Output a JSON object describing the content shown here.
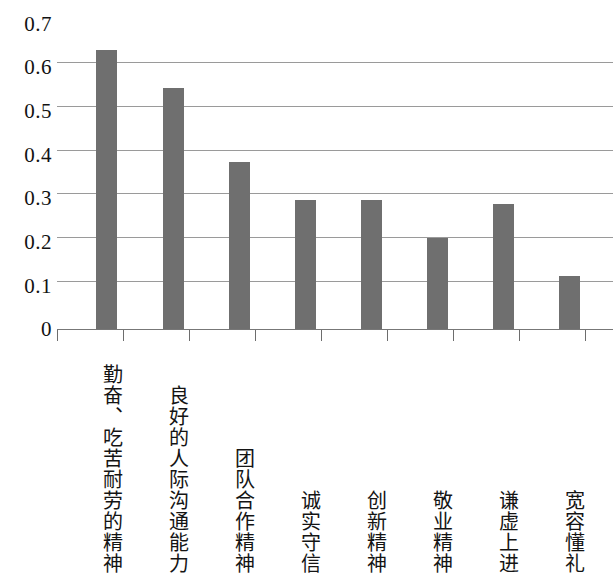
{
  "chart_data": {
    "type": "bar",
    "title": "",
    "subtitle": "",
    "xlabel": "",
    "ylabel": "",
    "ylim": [
      0,
      0.7
    ],
    "ytick_labels": [
      "0.7",
      "0.6",
      "0.5",
      "0.4",
      "0.3",
      "0.2",
      "0.1",
      "0"
    ],
    "ytick_values": [
      0.7,
      0.6,
      0.5,
      0.4,
      0.3,
      0.2,
      0.1,
      0
    ],
    "grid": "horizontal",
    "legend": "none",
    "bar_color": "#6f6f6f",
    "gridline_color": "#9a9a9a",
    "categories": [
      "勤奋、吃苦耐劳的精神",
      "良好的人际沟通能力",
      "团队合作精神",
      "诚实守信",
      "创新精神",
      "敬业精神",
      "谦虚上进",
      "宽容懂礼"
    ],
    "values": [
      0.64,
      0.553,
      0.384,
      0.295,
      0.295,
      0.209,
      0.287,
      0.121
    ],
    "series": [
      {
        "name": "",
        "values": [
          0.64,
          0.553,
          0.384,
          0.295,
          0.295,
          0.209,
          0.287,
          0.121
        ]
      }
    ]
  }
}
